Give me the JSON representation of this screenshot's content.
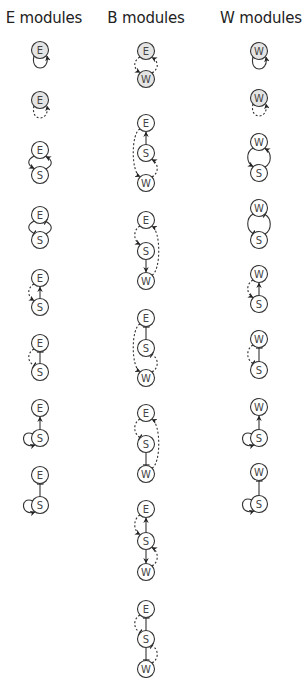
{
  "headers": {
    "e": "E modules",
    "b": "B modules",
    "w": "W modules"
  },
  "colors": {
    "stroke": "#333333",
    "shaded_node_fill": "#e4e4e4",
    "node_fill": "#ffffff",
    "label": "#444444"
  },
  "legend_semantics": {
    "solid_arrow": "activation (direct)",
    "dashed_arrow": "activation (indirect)",
    "bar_end": "inhibition"
  },
  "columns": [
    {
      "id": "e",
      "x": 40,
      "modules": [
        {
          "nodes": [
            {
              "id": "E",
              "label": "E",
              "y": 50,
              "shaded": true
            }
          ],
          "edges": [
            {
              "type": "self-loop",
              "node": "E",
              "style": "solid",
              "end": "arrow"
            }
          ]
        },
        {
          "nodes": [
            {
              "id": "E",
              "label": "E",
              "y": 100,
              "shaded": true
            }
          ],
          "edges": [
            {
              "type": "self-loop",
              "node": "E",
              "style": "dashed",
              "end": "arrow"
            }
          ]
        },
        {
          "nodes": [
            {
              "id": "E",
              "label": "E",
              "y": 150
            },
            {
              "id": "S",
              "label": "S",
              "y": 175
            }
          ],
          "edges": [
            {
              "from": "S",
              "to": "E",
              "style": "solid",
              "end": "arrow",
              "side": "right"
            },
            {
              "from": "E",
              "to": "S",
              "style": "solid",
              "end": "arrow",
              "side": "left"
            }
          ]
        },
        {
          "nodes": [
            {
              "id": "E",
              "label": "E",
              "y": 215
            },
            {
              "id": "S",
              "label": "S",
              "y": 240
            }
          ],
          "edges": [
            {
              "from": "S",
              "to": "E",
              "style": "solid",
              "end": "bar",
              "side": "right"
            },
            {
              "from": "E",
              "to": "S",
              "style": "solid",
              "end": "bar",
              "side": "left"
            }
          ]
        },
        {
          "nodes": [
            {
              "id": "E",
              "label": "E",
              "y": 278
            },
            {
              "id": "S",
              "label": "S",
              "y": 307
            }
          ],
          "edges": [
            {
              "from": "S",
              "to": "E",
              "style": "solid",
              "end": "arrow",
              "side": "straight"
            },
            {
              "from": "E",
              "to": "S",
              "style": "dashed",
              "end": "arrow",
              "side": "left"
            }
          ]
        },
        {
          "nodes": [
            {
              "id": "E",
              "label": "E",
              "y": 343
            },
            {
              "id": "S",
              "label": "S",
              "y": 372
            }
          ],
          "edges": [
            {
              "from": "S",
              "to": "E",
              "style": "solid",
              "end": "bar",
              "side": "straight"
            },
            {
              "from": "E",
              "to": "S",
              "style": "dashed",
              "end": "bar",
              "side": "left"
            }
          ]
        },
        {
          "nodes": [
            {
              "id": "E",
              "label": "E",
              "y": 408
            },
            {
              "id": "S",
              "label": "S",
              "y": 438
            }
          ],
          "edges": [
            {
              "from": "S",
              "to": "E",
              "style": "solid",
              "end": "arrow",
              "side": "straight"
            },
            {
              "type": "self-loop",
              "node": "S",
              "style": "solid",
              "end": "arrow",
              "side": "left"
            }
          ]
        },
        {
          "nodes": [
            {
              "id": "E",
              "label": "E",
              "y": 475
            },
            {
              "id": "S",
              "label": "S",
              "y": 505
            }
          ],
          "edges": [
            {
              "from": "S",
              "to": "E",
              "style": "solid",
              "end": "bar",
              "side": "straight"
            },
            {
              "type": "self-loop",
              "node": "S",
              "style": "solid",
              "end": "arrow",
              "side": "left"
            }
          ]
        }
      ]
    },
    {
      "id": "b",
      "x": 146,
      "modules": [
        {
          "nodes": [
            {
              "id": "E",
              "label": "E",
              "y": 51,
              "shaded": true
            },
            {
              "id": "W",
              "label": "W",
              "y": 79,
              "shaded": true
            }
          ],
          "edges": [
            {
              "from": "W",
              "to": "E",
              "style": "dashed",
              "end": "arrow",
              "side": "right"
            },
            {
              "from": "E",
              "to": "W",
              "style": "dashed",
              "end": "arrow",
              "side": "left"
            }
          ]
        },
        {
          "nodes": [
            {
              "id": "E",
              "label": "E",
              "y": 123
            },
            {
              "id": "S",
              "label": "S",
              "y": 153
            },
            {
              "id": "W",
              "label": "W",
              "y": 183
            }
          ],
          "edges": [
            {
              "from": "S",
              "to": "E",
              "style": "solid",
              "end": "arrow",
              "side": "straight"
            },
            {
              "from": "W",
              "to": "S",
              "style": "dashed",
              "end": "arrow",
              "side": "right"
            },
            {
              "from": "E",
              "to": "W",
              "style": "dashed",
              "end": "arrow",
              "side": "left-long"
            }
          ]
        },
        {
          "nodes": [
            {
              "id": "E",
              "label": "E",
              "y": 220
            },
            {
              "id": "S",
              "label": "S",
              "y": 251
            },
            {
              "id": "W",
              "label": "W",
              "y": 281
            }
          ],
          "edges": [
            {
              "from": "S",
              "to": "W",
              "style": "solid",
              "end": "arrow",
              "side": "straight"
            },
            {
              "from": "E",
              "to": "S",
              "style": "dashed",
              "end": "arrow",
              "side": "left"
            },
            {
              "from": "W",
              "to": "E",
              "style": "dashed",
              "end": "arrow",
              "side": "right-long"
            }
          ]
        },
        {
          "nodes": [
            {
              "id": "E",
              "label": "E",
              "y": 318
            },
            {
              "id": "S",
              "label": "S",
              "y": 348
            },
            {
              "id": "W",
              "label": "W",
              "y": 378
            }
          ],
          "edges": [
            {
              "from": "S",
              "to": "E",
              "style": "solid",
              "end": "bar",
              "side": "straight"
            },
            {
              "from": "W",
              "to": "S",
              "style": "dashed",
              "end": "bar",
              "side": "right"
            },
            {
              "from": "E",
              "to": "W",
              "style": "dashed",
              "end": "arrow",
              "side": "left-long"
            }
          ]
        },
        {
          "nodes": [
            {
              "id": "E",
              "label": "E",
              "y": 413
            },
            {
              "id": "S",
              "label": "S",
              "y": 444
            },
            {
              "id": "W",
              "label": "W",
              "y": 474
            }
          ],
          "edges": [
            {
              "from": "S",
              "to": "W",
              "style": "solid",
              "end": "bar",
              "side": "straight"
            },
            {
              "from": "E",
              "to": "S",
              "style": "dashed",
              "end": "bar",
              "side": "left"
            },
            {
              "from": "W",
              "to": "E",
              "style": "dashed",
              "end": "arrow",
              "side": "right-long"
            }
          ]
        },
        {
          "nodes": [
            {
              "id": "E",
              "label": "E",
              "y": 509
            },
            {
              "id": "S",
              "label": "S",
              "y": 541
            },
            {
              "id": "W",
              "label": "W",
              "y": 572
            }
          ],
          "edges": [
            {
              "from": "S",
              "to": "E",
              "style": "solid",
              "end": "arrow",
              "side": "straight"
            },
            {
              "from": "S",
              "to": "W",
              "style": "solid",
              "end": "arrow",
              "side": "straight"
            },
            {
              "from": "E",
              "to": "S",
              "style": "dashed",
              "end": "arrow",
              "side": "left"
            },
            {
              "from": "W",
              "to": "S",
              "style": "dashed",
              "end": "arrow",
              "side": "right"
            }
          ]
        },
        {
          "nodes": [
            {
              "id": "E",
              "label": "E",
              "y": 609
            },
            {
              "id": "S",
              "label": "S",
              "y": 639
            },
            {
              "id": "W",
              "label": "W",
              "y": 669
            }
          ],
          "edges": [
            {
              "from": "S",
              "to": "E",
              "style": "solid",
              "end": "bar",
              "side": "straight"
            },
            {
              "from": "S",
              "to": "W",
              "style": "solid",
              "end": "bar",
              "side": "straight"
            },
            {
              "from": "E",
              "to": "S",
              "style": "dashed",
              "end": "bar",
              "side": "left"
            },
            {
              "from": "W",
              "to": "S",
              "style": "dashed",
              "end": "bar",
              "side": "right"
            }
          ]
        }
      ]
    },
    {
      "id": "w",
      "x": 259,
      "modules": [
        {
          "nodes": [
            {
              "id": "W",
              "label": "W",
              "y": 51,
              "shaded": true
            }
          ],
          "edges": [
            {
              "type": "self-loop",
              "node": "W",
              "style": "solid",
              "end": "arrow"
            }
          ]
        },
        {
          "nodes": [
            {
              "id": "W",
              "label": "W",
              "y": 98,
              "shaded": true
            }
          ],
          "edges": [
            {
              "type": "self-loop",
              "node": "W",
              "style": "dashed",
              "end": "arrow"
            }
          ]
        },
        {
          "nodes": [
            {
              "id": "W",
              "label": "W",
              "y": 142
            },
            {
              "id": "S",
              "label": "S",
              "y": 173
            }
          ],
          "edges": [
            {
              "from": "S",
              "to": "W",
              "style": "solid",
              "end": "arrow",
              "side": "right"
            },
            {
              "from": "W",
              "to": "S",
              "style": "solid",
              "end": "arrow",
              "side": "left"
            }
          ]
        },
        {
          "nodes": [
            {
              "id": "W",
              "label": "W",
              "y": 208
            },
            {
              "id": "S",
              "label": "S",
              "y": 240
            }
          ],
          "edges": [
            {
              "from": "S",
              "to": "W",
              "style": "solid",
              "end": "bar",
              "side": "right"
            },
            {
              "from": "W",
              "to": "S",
              "style": "solid",
              "end": "bar",
              "side": "left"
            }
          ]
        },
        {
          "nodes": [
            {
              "id": "W",
              "label": "W",
              "y": 274
            },
            {
              "id": "S",
              "label": "S",
              "y": 304
            }
          ],
          "edges": [
            {
              "from": "S",
              "to": "W",
              "style": "solid",
              "end": "arrow",
              "side": "straight"
            },
            {
              "from": "W",
              "to": "S",
              "style": "dashed",
              "end": "arrow",
              "side": "left"
            }
          ]
        },
        {
          "nodes": [
            {
              "id": "W",
              "label": "W",
              "y": 339
            },
            {
              "id": "S",
              "label": "S",
              "y": 370
            }
          ],
          "edges": [
            {
              "from": "S",
              "to": "W",
              "style": "solid",
              "end": "bar",
              "side": "straight"
            },
            {
              "from": "W",
              "to": "S",
              "style": "dashed",
              "end": "bar",
              "side": "left"
            }
          ]
        },
        {
          "nodes": [
            {
              "id": "W",
              "label": "W",
              "y": 407
            },
            {
              "id": "S",
              "label": "S",
              "y": 438
            }
          ],
          "edges": [
            {
              "from": "S",
              "to": "W",
              "style": "solid",
              "end": "arrow",
              "side": "straight"
            },
            {
              "type": "self-loop",
              "node": "S",
              "style": "solid",
              "end": "arrow",
              "side": "left"
            }
          ]
        },
        {
          "nodes": [
            {
              "id": "W",
              "label": "W",
              "y": 472
            },
            {
              "id": "S",
              "label": "S",
              "y": 504
            }
          ],
          "edges": [
            {
              "from": "S",
              "to": "W",
              "style": "solid",
              "end": "bar",
              "side": "straight"
            },
            {
              "type": "self-loop",
              "node": "S",
              "style": "solid",
              "end": "arrow",
              "side": "left"
            }
          ]
        }
      ]
    }
  ]
}
